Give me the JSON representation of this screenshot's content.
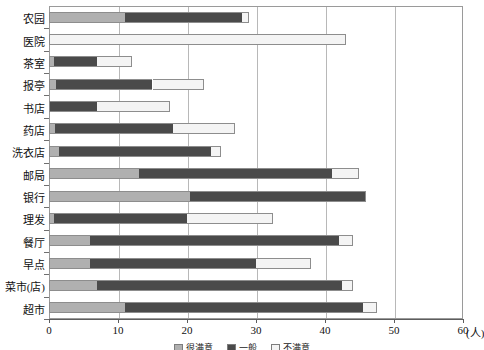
{
  "chart_data": {
    "type": "bar",
    "orientation": "horizontal",
    "stacked": true,
    "title": "",
    "xlabel": "(人)",
    "ylabel": "",
    "xlim": [
      0,
      60
    ],
    "xticks": [
      0,
      10,
      20,
      30,
      40,
      50,
      60
    ],
    "xtick_labels": [
      "0",
      "10",
      "20",
      "30",
      "40",
      "50",
      "60"
    ],
    "grid": true,
    "grid_axis": "x",
    "legend_position": "bottom",
    "categories": [
      "农园",
      "医院",
      "茶室",
      "报亭",
      "书店",
      "药店",
      "洗衣店",
      "邮局",
      "银行",
      "理发",
      "餐厅",
      "早点",
      "菜市(店)",
      "超市"
    ],
    "series": [
      {
        "name": "很满意",
        "color": "#b0b0b0",
        "values": [
          11.0,
          0.0,
          0.7,
          1.0,
          0.0,
          0.8,
          1.5,
          13.0,
          20.5,
          0.7,
          6.0,
          6.0,
          7.0,
          11.0
        ]
      },
      {
        "name": "一般",
        "color": "#4a4a4a",
        "values": [
          17.0,
          0.0,
          6.3,
          14.0,
          7.0,
          17.2,
          22.0,
          28.0,
          25.5,
          19.3,
          36.0,
          24.0,
          35.5,
          34.5
        ]
      },
      {
        "name": "不满意",
        "color": "#f4f4f4",
        "values": [
          1.0,
          43.0,
          5.0,
          7.5,
          10.5,
          9.0,
          1.5,
          4.0,
          0.0,
          12.5,
          2.0,
          8.0,
          1.5,
          2.0
        ]
      }
    ],
    "totals": [
      29.0,
      43.0,
      12.0,
      22.5,
      17.5,
      27.0,
      25.0,
      45.0,
      46.0,
      32.5,
      44.0,
      38.0,
      44.0,
      47.5
    ]
  },
  "colors": {
    "satisfied": "#b0b0b0",
    "neutral": "#4a4a4a",
    "unsatisfied": "#f4f4f4",
    "frame": "#9a9a9a",
    "grid": "#b8b8b8",
    "axis": "#5d5d5d",
    "text": "#111111"
  }
}
